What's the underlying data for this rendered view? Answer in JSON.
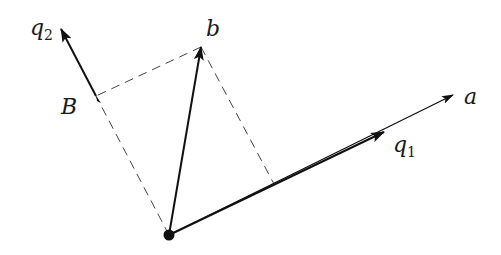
{
  "diagram": {
    "colors": {
      "ink": "#111111",
      "dash": "#444444",
      "background": "#ffffff"
    },
    "points": {
      "origin": {
        "x": 169,
        "y": 235
      },
      "b": {
        "x": 201,
        "y": 47
      },
      "B": {
        "x": 96,
        "y": 96
      },
      "q2_tip": {
        "x": 61,
        "y": 29
      },
      "q1_head": {
        "x": 384,
        "y": 132
      },
      "a_tip": {
        "x": 453,
        "y": 95
      },
      "foot_a": {
        "x": 274,
        "y": 184
      }
    },
    "labels": {
      "q2": {
        "main": "q",
        "sub": "2"
      },
      "b": "b",
      "B": "B",
      "a": "a",
      "q1": {
        "main": "q",
        "sub": "1"
      }
    },
    "edges": [
      {
        "from": "origin",
        "to": "b",
        "style": "solid-arrow",
        "name": "vector-b"
      },
      {
        "from": "origin",
        "to": "a_tip",
        "style": "solid-arrow",
        "name": "vector-a"
      },
      {
        "from": "origin",
        "to": "q1_head",
        "style": "thick-arrow",
        "name": "vector-q1"
      },
      {
        "from": "B",
        "to": "q2_tip",
        "style": "solid-arrow",
        "name": "vector-q2"
      },
      {
        "from": "b",
        "to": "B",
        "style": "dashed",
        "name": "projection-b-to-B"
      },
      {
        "from": "b",
        "to": "foot_a",
        "style": "dashed",
        "name": "projection-b-to-a"
      },
      {
        "from": "origin",
        "to": "B",
        "style": "dashed",
        "name": "line-origin-to-B"
      }
    ]
  }
}
